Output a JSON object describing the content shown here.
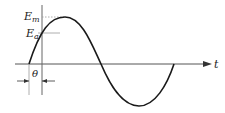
{
  "diagram": {
    "type": "sine-wave-phase-diagram",
    "labels": {
      "peak": "E",
      "peak_sub": "m",
      "instant": "E",
      "instant_sub": "a",
      "phase": "θ",
      "time_axis": "t"
    },
    "colors": {
      "curve": "#1a1a1a",
      "axis": "#555555",
      "guide": "#999999"
    }
  }
}
